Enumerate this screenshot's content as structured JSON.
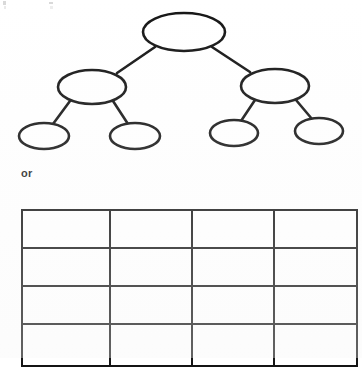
{
  "page": {
    "background_color": "#ffffff",
    "ink_color": "#151515",
    "width": 362,
    "height": 358
  },
  "tree": {
    "name": "blank-hierarchy-tree",
    "shape": "ellipse",
    "levels": 3,
    "node_count": 7,
    "nodes": [
      {
        "id": "root",
        "label": "",
        "cx": 184,
        "cy": 32,
        "rx": 41,
        "ry": 19,
        "level": 0
      },
      {
        "id": "mid-left",
        "label": "",
        "cx": 92,
        "cy": 87,
        "rx": 34,
        "ry": 17,
        "level": 1
      },
      {
        "id": "mid-right",
        "label": "",
        "cx": 275,
        "cy": 86,
        "rx": 34,
        "ry": 17,
        "level": 1
      },
      {
        "id": "leaf-1",
        "label": "",
        "cx": 44,
        "cy": 136,
        "rx": 25,
        "ry": 13,
        "level": 2
      },
      {
        "id": "leaf-2",
        "label": "",
        "cx": 135,
        "cy": 136,
        "rx": 25,
        "ry": 13,
        "level": 2
      },
      {
        "id": "leaf-3",
        "label": "",
        "cx": 234,
        "cy": 133,
        "rx": 24,
        "ry": 13,
        "level": 2
      },
      {
        "id": "leaf-4",
        "label": "",
        "cx": 319,
        "cy": 131,
        "rx": 24,
        "ry": 13,
        "level": 2
      }
    ],
    "edges": [
      {
        "from": "root",
        "to": "mid-left",
        "x1": 155,
        "y1": 47,
        "x2": 117,
        "y2": 73
      },
      {
        "from": "root",
        "to": "mid-right",
        "x1": 212,
        "y1": 47,
        "x2": 250,
        "y2": 72
      },
      {
        "from": "mid-left",
        "to": "leaf-1",
        "x1": 70,
        "y1": 101,
        "x2": 53,
        "y2": 124
      },
      {
        "from": "mid-left",
        "to": "leaf-2",
        "x1": 113,
        "y1": 101,
        "x2": 128,
        "y2": 124
      },
      {
        "from": "mid-right",
        "to": "leaf-3",
        "x1": 255,
        "y1": 100,
        "x2": 241,
        "y2": 121
      },
      {
        "from": "mid-right",
        "to": "leaf-4",
        "x1": 296,
        "y1": 100,
        "x2": 312,
        "y2": 119
      }
    ]
  },
  "connector": {
    "label": "or"
  },
  "grid": {
    "name": "blank-table-grid",
    "rows": 4,
    "columns": 4,
    "column_widths": [
      86,
      80,
      80,
      81
    ],
    "cells": [
      [
        "",
        "",
        "",
        ""
      ],
      [
        "",
        "",
        "",
        ""
      ],
      [
        "",
        "",
        "",
        ""
      ],
      [
        "",
        "",
        "",
        ""
      ]
    ]
  }
}
